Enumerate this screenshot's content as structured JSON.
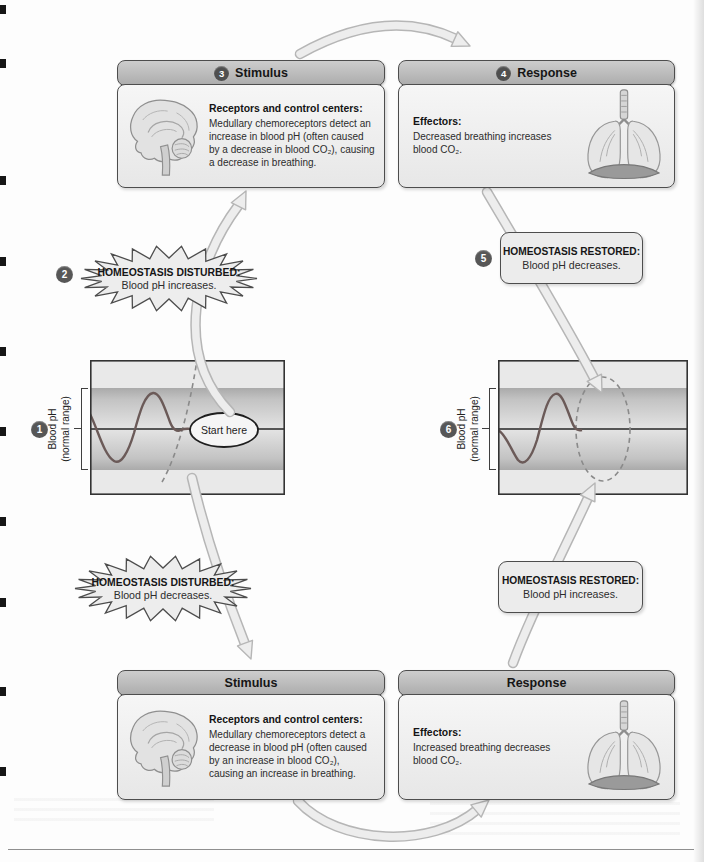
{
  "palette": {
    "header_bg": "#b9b9b9",
    "panel_bg": "#f0f0f0",
    "outline": "#4d4d4d",
    "badge_bg": "#575757",
    "arrow_fill": "#ededed",
    "arrow_edge": "#b6b6b6",
    "band_gray": "#b3b3b3",
    "wave_color": "#6b5a58"
  },
  "panels": [
    {
      "badge": "3",
      "title": "Stimulus",
      "heading": "Receptors and control centers:",
      "body": "Medullary chemoreceptors detect an increase in blood pH (often caused by a decrease in blood CO₂), causing a decrease in breathing.",
      "icon": "brain-icon"
    },
    {
      "badge": "4",
      "title": "Response",
      "heading": "Effectors:",
      "body": "Decreased breathing increases blood CO₂.",
      "icon": "lungs-icon"
    },
    {
      "badge": "",
      "title": "Stimulus",
      "heading": "Receptors and control centers:",
      "body": "Medullary chemoreceptors detect a decrease in blood pH (often caused by an increase in blood CO₂), causing an increase in breathing.",
      "icon": "brain-icon"
    },
    {
      "badge": "",
      "title": "Response",
      "heading": "Effectors:",
      "body": "Increased breathing decreases blood CO₂.",
      "icon": "lungs-icon"
    }
  ],
  "callouts": [
    {
      "badge": "2",
      "title": "HOMEOSTASIS DISTURBED:",
      "body": "Blood pH increases.",
      "shape": "starburst"
    },
    {
      "badge": "5",
      "title": "HOMEOSTASIS RESTORED:",
      "body": "Blood pH decreases.",
      "shape": "rounded"
    },
    {
      "badge": "",
      "title": "HOMEOSTASIS DISTURBED:",
      "body": "Blood pH decreases.",
      "shape": "starburst"
    },
    {
      "badge": "",
      "title": "HOMEOSTASIS RESTORED:",
      "body": "Blood pH increases.",
      "shape": "rounded"
    }
  ],
  "graphs": [
    {
      "badge": "1",
      "ylabel_line1": "Blood pH",
      "ylabel_line2": "(normal range)",
      "annotation": "Start here"
    },
    {
      "badge": "6",
      "ylabel_line1": "Blood pH",
      "ylabel_line2": "(normal range)",
      "annotation": ""
    }
  ]
}
